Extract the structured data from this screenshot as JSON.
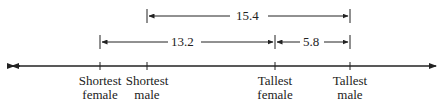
{
  "diagram": {
    "type": "number-line",
    "points": [
      {
        "id": "shortest-female",
        "line1": "Shortest",
        "line2": "female",
        "x": 100
      },
      {
        "id": "shortest-male",
        "line1": "Shortest",
        "line2": "male",
        "x": 147
      },
      {
        "id": "tallest-female",
        "line1": "Tallest",
        "line2": "female",
        "x": 275
      },
      {
        "id": "tallest-male",
        "line1": "Tallest",
        "line2": "male",
        "x": 350
      }
    ],
    "spans": [
      {
        "label": "15.4",
        "from": "shortest-male",
        "to": "tallest-male"
      },
      {
        "label": "13.2",
        "from": "shortest-female",
        "to": "tallest-female"
      },
      {
        "label": "5.8",
        "from": "tallest-female",
        "to": "tallest-male"
      }
    ],
    "colors": {
      "line": "#222222",
      "background": "#ffffff"
    }
  }
}
